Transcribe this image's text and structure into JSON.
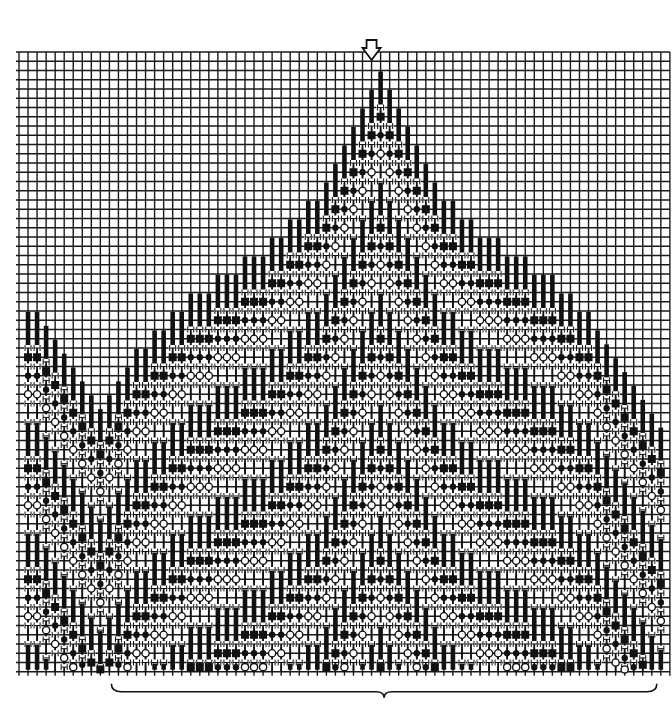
{
  "grid": {
    "x0": 19,
    "y0": 52,
    "cols": 72,
    "rows": 67,
    "cell_w": 9.04,
    "cell_h": 9.25,
    "line_color": "#1a1a1a"
  },
  "legend_symbols": {
    "bar": "solid-black-stitch",
    "square": "filled-square",
    "dot": "filled-dot",
    "circle": "open-circle",
    "plain": "thin-stitch",
    "gap": "H-gap"
  },
  "band_sequence": [
    "bar",
    "square",
    "dot",
    "circle",
    "plain"
  ],
  "band_rows": {
    "bar": 4,
    "square": 2,
    "dot": 2,
    "circle": 2,
    "plain": 2
  },
  "center_marker": {
    "label": "center",
    "col": 39,
    "symbol": "down-arrow"
  },
  "pattern": {
    "first_col": 1,
    "last_col": 71,
    "tops_rows": [
      28,
      28,
      29.5,
      31,
      32.5,
      34,
      35.5,
      37,
      38.5,
      37,
      35.5,
      34,
      32,
      32,
      30,
      30,
      28,
      28,
      26,
      26,
      26,
      24,
      24,
      24,
      22,
      22,
      22,
      20,
      20,
      18,
      18,
      16,
      16,
      14,
      12,
      10,
      8,
      6,
      4,
      2,
      4,
      6,
      8,
      10,
      12,
      14,
      16,
      16,
      18,
      18,
      20,
      20,
      20,
      22,
      22,
      22,
      24,
      24,
      24,
      26,
      26,
      28,
      28,
      30,
      31.5,
      33,
      34.5,
      36,
      37.5,
      39,
      40.5
    ]
  },
  "bracket": {
    "from_col": 10,
    "to_col": 71,
    "label": ""
  },
  "colors": {
    "ink": "#111111",
    "paper": "#ffffff"
  }
}
